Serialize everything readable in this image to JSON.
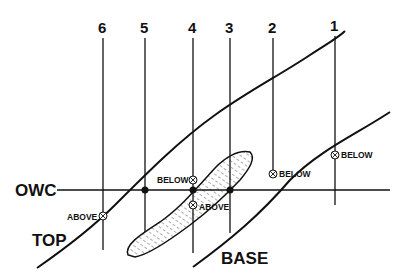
{
  "diagram": {
    "labels": {
      "owc": "OWC",
      "top": "TOP",
      "base": "BASE"
    },
    "wells": [
      {
        "id": "1",
        "x": 335,
        "bottom": 205,
        "marker": {
          "y": 155,
          "label": "BELOW",
          "side": "right"
        }
      },
      {
        "id": "2",
        "x": 273,
        "bottom": 173,
        "marker": {
          "y": 173,
          "label": "BELOW",
          "side": "right"
        }
      },
      {
        "id": "3",
        "x": 230,
        "bottom": 233,
        "marker": null
      },
      {
        "id": "4",
        "x": 193,
        "bottom": 253,
        "marker": {
          "y": 180,
          "label": "BELOW",
          "side": "left"
        },
        "marker2": {
          "y": 205,
          "label": "ABOVE",
          "side": "right"
        }
      },
      {
        "id": "5",
        "x": 145,
        "bottom": 232,
        "marker": null
      },
      {
        "id": "6",
        "x": 103,
        "bottom": 250,
        "marker": {
          "y": 216,
          "label": "ABOVE",
          "side": "left"
        }
      }
    ],
    "owc_intersections_x": [
      145,
      193,
      230
    ],
    "colors": {
      "line": "#111111",
      "background": "#ffffff",
      "hatch": "#333333"
    }
  }
}
